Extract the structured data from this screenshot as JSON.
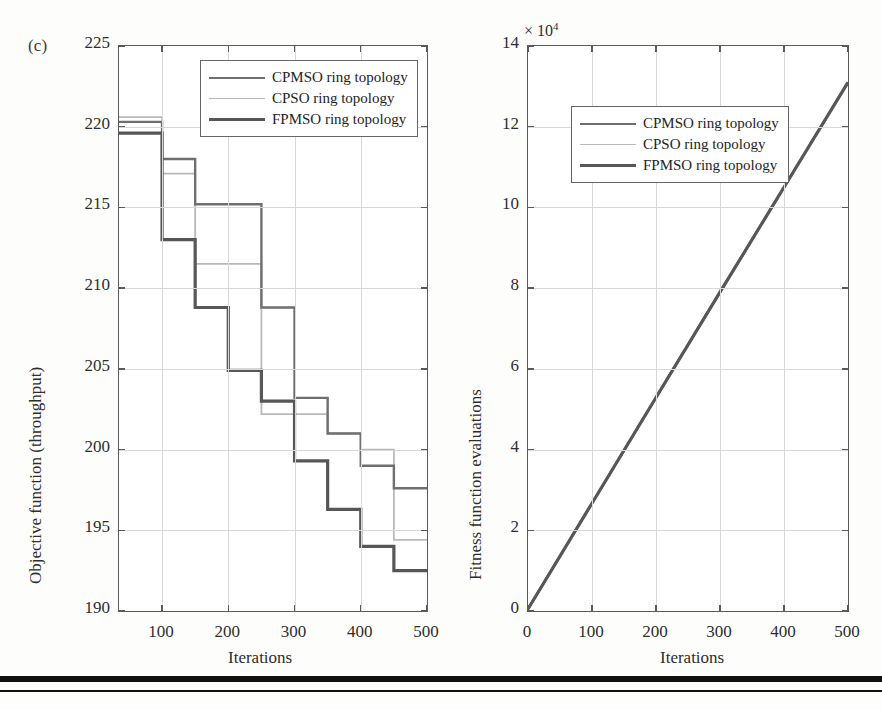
{
  "figure": {
    "panel_label": "(c)",
    "background": "#fdfdfc",
    "rule_color": "#111111"
  },
  "series_style": {
    "cpmso_color": "#6f6f6f",
    "cpso_color": "#b9b9b9",
    "fpmso_color": "#575757",
    "cpmso_width": 2.4,
    "cpso_width": 1.8,
    "fpmso_width": 3.2
  },
  "legend": {
    "entries": [
      {
        "label": "CPMSO ring topology",
        "color": "#6f6f6f",
        "width": 2.4
      },
      {
        "label": "CPSO ring topology",
        "color": "#b9b9b9",
        "width": 1.8
      },
      {
        "label": "FPMSO ring topology",
        "color": "#575757",
        "width": 3.2
      }
    ]
  },
  "chart_data": [
    {
      "id": "left",
      "type": "line",
      "subtype": "step-post",
      "title": "",
      "panel_label": "(c)",
      "xlabel": "Iterations",
      "ylabel": "Objective function (throughput)",
      "xlim": [
        35,
        500
      ],
      "ylim": [
        190,
        225
      ],
      "xticks": [
        100,
        200,
        300,
        400,
        500
      ],
      "yticks": [
        190,
        195,
        200,
        205,
        210,
        215,
        220,
        225
      ],
      "grid": true,
      "legend_position": "top-right",
      "x": [
        35,
        100,
        150,
        200,
        250,
        300,
        350,
        400,
        450,
        500
      ],
      "series": [
        {
          "name": "CPMSO ring topology",
          "color": "#6f6f6f",
          "values": [
            220.3,
            218.0,
            215.2,
            215.2,
            208.8,
            203.2,
            201.0,
            199.0,
            197.6,
            197.6
          ]
        },
        {
          "name": "CPSO ring topology",
          "color": "#b9b9b9",
          "values": [
            220.6,
            217.1,
            211.5,
            211.5,
            202.2,
            202.2,
            201.0,
            200.0,
            194.4,
            194.4
          ]
        },
        {
          "name": "FPMSO ring topology",
          "color": "#575757",
          "values": [
            219.6,
            213.0,
            208.8,
            204.9,
            203.0,
            199.3,
            196.3,
            194.0,
            192.5,
            192.5
          ]
        }
      ]
    },
    {
      "id": "right",
      "type": "line",
      "title": "",
      "xlabel": "Iterations",
      "ylabel": "Fitness function evaluations",
      "y_exponent_label": "× 10",
      "y_exponent_power": "4",
      "xlim": [
        0,
        500
      ],
      "ylim": [
        0,
        14
      ],
      "xticks": [
        0,
        100,
        200,
        300,
        400,
        500
      ],
      "yticks": [
        0,
        2,
        4,
        6,
        8,
        10,
        12,
        14
      ],
      "grid": true,
      "legend_position": "top-left",
      "x": [
        0,
        100,
        200,
        300,
        400,
        500
      ],
      "series": [
        {
          "name": "CPMSO ring topology",
          "color": "#6f6f6f",
          "values": [
            0.05,
            2.67,
            5.29,
            7.9,
            10.5,
            13.1
          ]
        },
        {
          "name": "CPSO ring topology",
          "color": "#b9b9b9",
          "values": [
            0.05,
            2.67,
            5.29,
            7.9,
            10.5,
            13.1
          ]
        },
        {
          "name": "FPMSO ring topology",
          "color": "#575757",
          "values": [
            0.05,
            2.67,
            5.29,
            7.9,
            10.5,
            13.1
          ]
        }
      ]
    }
  ]
}
